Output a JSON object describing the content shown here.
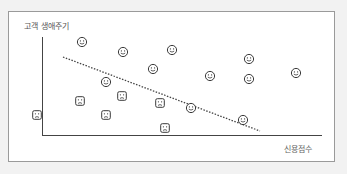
{
  "chart_data": {
    "type": "scatter",
    "title": "",
    "xlabel": "신용점수",
    "ylabel": "고객 생애주기",
    "grid": false,
    "legend": null,
    "series": [
      {
        "name": "happy",
        "marker": "smiley-round",
        "points": [
          [
            82,
            42
          ],
          [
            123,
            52
          ],
          [
            172,
            50
          ],
          [
            153,
            69
          ],
          [
            249,
            59
          ],
          [
            210,
            76
          ],
          [
            296,
            73
          ],
          [
            249,
            79
          ],
          [
            106,
            82
          ],
          [
            191,
            108
          ],
          [
            243,
            120
          ]
        ]
      },
      {
        "name": "sad",
        "marker": "frown-square",
        "points": [
          [
            80,
            101
          ],
          [
            122,
            96
          ],
          [
            160,
            103
          ],
          [
            37,
            115
          ],
          [
            106,
            115
          ],
          [
            165,
            128
          ]
        ]
      }
    ],
    "trendline": {
      "style": "dotted",
      "from": [
        63,
        57
      ],
      "to": [
        260,
        131
      ]
    }
  },
  "labels": {
    "y_axis": "고객 생애주기",
    "x_axis": "신용점수"
  },
  "colors": {
    "stroke": "#3a3a3a",
    "frame_border": "#9a9a9a",
    "background": "#f2f2f2"
  }
}
